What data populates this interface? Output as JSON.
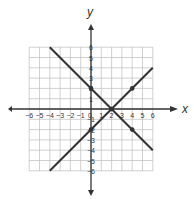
{
  "chart_data": {
    "type": "line",
    "title": "",
    "xlabel": "x",
    "ylabel": "y",
    "xlim": [
      -6,
      6
    ],
    "ylim": [
      -6,
      6
    ],
    "grid": true,
    "x_ticks": [
      -6,
      -5,
      -4,
      -3,
      -2,
      -1,
      0,
      1,
      2,
      3,
      4,
      5,
      6
    ],
    "y_ticks": [
      -6,
      -5,
      -4,
      -3,
      -2,
      -1,
      1,
      2,
      3,
      4,
      5,
      6
    ],
    "series": [
      {
        "name": "y = -x + 2",
        "x": [
          -4,
          6
        ],
        "y": [
          6,
          -4
        ],
        "color": "#333333",
        "marked_points": [
          [
            0,
            2
          ],
          [
            2,
            0
          ],
          [
            4,
            -2
          ]
        ]
      },
      {
        "name": "y = x - 2",
        "x": [
          -4,
          6
        ],
        "y": [
          -6,
          4
        ],
        "color": "#333333",
        "marked_points": [
          [
            0,
            -2
          ],
          [
            2,
            0
          ],
          [
            4,
            2
          ]
        ]
      }
    ],
    "intersection": [
      2,
      0
    ]
  },
  "colors": {
    "grid": "#bdbdbd",
    "axis": "#333333",
    "line": "#333333"
  }
}
